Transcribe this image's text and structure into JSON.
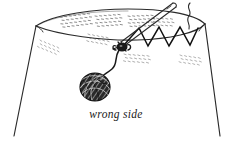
{
  "figure": {
    "caption": "wrong side",
    "background_color": "#ffffff",
    "ink_color": "#1a1a1a",
    "texture_color": "#555555",
    "width": 235,
    "height": 148
  },
  "parts": {
    "fabric_label": "fabric-body",
    "rim_label": "fabric-top-rim",
    "needle_label": "sewing-needle",
    "zigzag_label": "zigzag-stitch-line",
    "knot_label": "thread-knot",
    "thread_label": "thread-strand",
    "ball_label": "thread-ball",
    "tail_label": "loose-thread-tail"
  },
  "geometry": {
    "rim_outer": "M 36,26 C 54,14 96,9 128,9 C 160,9 194,13 205,24",
    "rim_inner": "M 36,26 C 58,35 104,41 137,40 C 170,39 197,33 205,24",
    "rim_fold_left": "M 36,26 L 38,31",
    "rim_fold_right": "M 205,24 L 203,30",
    "left_edge": "M 36,26 L 14,136",
    "right_edge": "M 205,24 L 220,136",
    "needle": "M 172,4 L 122,43",
    "needle_inner": "M 174,7 L 124,46",
    "needle_tip": "M 120,44 L 124,47",
    "zigzag": "M 124,45 L 139,28 L 148,46 L 159,27 L 169,46 L 180,27 L 190,45 L 198,28",
    "thread": "M 119,47 C 113,56 116,64 110,70 C 105,75 100,76 99,79",
    "tail": "M 190,3 C 186,8 192,11 189,16 C 186,21 190,24 188,28"
  },
  "ball": {
    "cx": 95,
    "cy": 87,
    "rx": 15,
    "ry": 14
  },
  "texture_patches": [
    {
      "name": "rim-stipple-left",
      "x": 60,
      "y": 17,
      "rows": 4,
      "cols": 7,
      "angle": -7,
      "opacity": 0.85
    },
    {
      "name": "rim-stipple-mid",
      "x": 95,
      "y": 16,
      "rows": 4,
      "cols": 6,
      "angle": -4,
      "opacity": 0.85
    },
    {
      "name": "rim-stipple-right",
      "x": 128,
      "y": 16,
      "rows": 4,
      "cols": 6,
      "angle": -2,
      "opacity": 0.85
    },
    {
      "name": "rim-stipple-far",
      "x": 152,
      "y": 18,
      "rows": 3,
      "cols": 5,
      "angle": 2,
      "opacity": 0.75
    },
    {
      "name": "body-stipple-left",
      "x": 40,
      "y": 40,
      "rows": 3,
      "cols": 5,
      "angle": 22,
      "opacity": 0.55
    },
    {
      "name": "body-stipple-mid",
      "x": 88,
      "y": 34,
      "rows": 3,
      "cols": 5,
      "angle": 10,
      "opacity": 0.6
    },
    {
      "name": "body-stipple-knot",
      "x": 124,
      "y": 54,
      "rows": 3,
      "cols": 6,
      "angle": 4,
      "opacity": 0.6
    },
    {
      "name": "body-stipple-right",
      "x": 180,
      "y": 55,
      "rows": 3,
      "cols": 5,
      "angle": 8,
      "opacity": 0.55
    }
  ],
  "caption_position": {
    "x": 116,
    "y": 118
  }
}
